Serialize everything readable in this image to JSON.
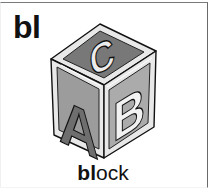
{
  "card": {
    "blend": "bl",
    "word": {
      "highlight": "bl",
      "rest": "ock"
    },
    "illustration": {
      "subject": "alphabet block",
      "face_letters": {
        "top": "C",
        "left": "A",
        "right": "B"
      }
    }
  },
  "colors": {
    "border": "#6a6a6a",
    "block_frame": "#e6e6e6",
    "top_face": "#777777",
    "left_face": "#9a9a9a",
    "right_face": "#a8a8a8",
    "letter_A": "#6e6e6e",
    "letter_B": "#f2f2f2",
    "letter_C": "#ececec"
  }
}
